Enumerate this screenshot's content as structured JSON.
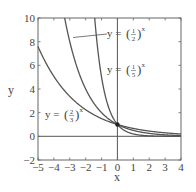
{
  "chart_data": {
    "type": "line",
    "title": "",
    "xlabel": "x",
    "ylabel": "y",
    "xlim": [
      -5,
      4
    ],
    "ylim": [
      -2,
      10
    ],
    "xticks": [
      -5,
      -4,
      -3,
      -2,
      -1,
      0,
      1,
      2,
      3,
      4
    ],
    "yticks": [
      -2,
      0,
      2,
      4,
      6,
      8,
      10
    ],
    "xtick_labels": [
      "−5",
      "−4",
      "−3",
      "−2",
      "−1",
      "0",
      "1",
      "2",
      "3",
      "4"
    ],
    "ytick_labels": [
      "−2",
      "0",
      "2",
      "4",
      "6",
      "8",
      "10"
    ],
    "grid": false,
    "series": [
      {
        "name": "y = (1/2)^x",
        "base": 0.5,
        "numerator": "1",
        "denominator": "2",
        "x": [
          -3.32,
          -3,
          -2,
          -1,
          0,
          1,
          2,
          3,
          4
        ],
        "values": [
          10,
          8,
          4,
          2,
          1,
          0.5,
          0.25,
          0.125,
          0.0625
        ]
      },
      {
        "name": "y = (1/5)^x",
        "base": 0.2,
        "numerator": "1",
        "denominator": "5",
        "x": [
          -1.43,
          -1,
          0,
          1,
          2,
          3,
          4
        ],
        "values": [
          10,
          5,
          1,
          0.2,
          0.04,
          0.008,
          0.0016
        ]
      },
      {
        "name": "y = (2/3)^x",
        "base": 0.6667,
        "numerator": "2",
        "denominator": "3",
        "x": [
          -5,
          -4,
          -3,
          -2,
          -1,
          0,
          1,
          2,
          3,
          4
        ],
        "values": [
          7.59,
          5.06,
          3.375,
          2.25,
          1.5,
          1,
          0.667,
          0.444,
          0.296,
          0.198
        ]
      }
    ],
    "annotations": [
      {
        "text": "y = (1/2)^x",
        "pointer_to": "curve (1/2)^x near x≈-3"
      },
      {
        "text": "y = (1/5)^x",
        "position": "right of y-axis, mid-upper"
      },
      {
        "text": "y = (2/3)^x",
        "position": "lower left"
      },
      {
        "text": "common point",
        "x": 0,
        "y": 1
      }
    ]
  },
  "labels": {
    "x_axis": "x",
    "y_axis": "y",
    "curve_half": {
      "prefix": "y = ",
      "num": "1",
      "den": "2",
      "exp": "x"
    },
    "curve_fifth": {
      "prefix": "y = ",
      "num": "1",
      "den": "5",
      "exp": "x"
    },
    "curve_twothirds": {
      "prefix": "y = ",
      "num": "2",
      "den": "3",
      "exp": "x"
    }
  },
  "ticks": {
    "x": [
      "−5",
      "−4",
      "−3",
      "−2",
      "−1",
      "0",
      "1",
      "2",
      "3",
      "4"
    ],
    "y": [
      "−2",
      "0",
      "2",
      "4",
      "6",
      "8",
      "10"
    ]
  },
  "colors": {
    "curve": "#555555",
    "axis": "#555555",
    "background": "#ffffff"
  }
}
